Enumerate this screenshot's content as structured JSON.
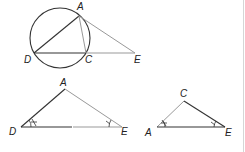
{
  "figure_1": {
    "title": "Circle with inscribed triangle and external point",
    "labels": {
      "A": "A",
      "D": "D",
      "C": "C",
      "E": "E"
    }
  },
  "figure_2": {
    "title": "Triangle ADE",
    "labels": {
      "A": "A",
      "D": "D",
      "E": "E"
    },
    "angle_marks": {
      "D": "*",
      "E": "+"
    }
  },
  "figure_3": {
    "title": "Triangle ACE",
    "labels": {
      "C": "C",
      "A": "A",
      "E": "E"
    },
    "angle_marks": {
      "A": "*",
      "E": "+"
    }
  },
  "colors": {
    "dark_stroke": "#333333",
    "light_stroke": "#999999",
    "label": "#222222",
    "border": "#d6d6d6"
  }
}
